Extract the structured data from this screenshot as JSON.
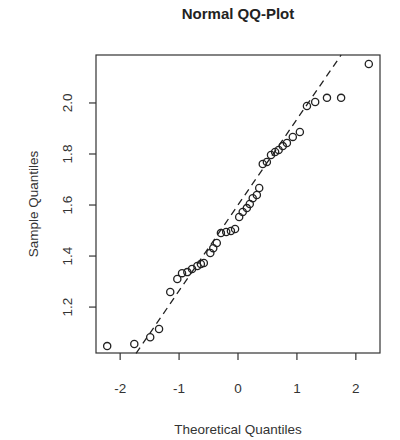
{
  "chart_data": {
    "type": "scatter",
    "title": "Normal QQ-Plot",
    "xlabel": "Theoretical Quantiles",
    "ylabel": "Sample Quantiles",
    "xlim": [
      -2.41,
      2.41
    ],
    "ylim": [
      1.02,
      2.188
    ],
    "grid": false,
    "legend": null,
    "x_ticks": [
      -2,
      -1,
      0,
      1,
      2
    ],
    "x_tick_labels": [
      "-2",
      "-1",
      "0",
      "1",
      "2"
    ],
    "y_ticks": [
      1.2,
      1.4,
      1.6,
      1.8,
      2.0
    ],
    "y_tick_labels": [
      "1.2",
      "1.4",
      "1.6",
      "1.8",
      "2.0"
    ],
    "points": [
      {
        "x": -2.22,
        "y": 1.047
      },
      {
        "x": -1.76,
        "y": 1.055
      },
      {
        "x": -1.49,
        "y": 1.082
      },
      {
        "x": -1.34,
        "y": 1.114
      },
      {
        "x": -1.15,
        "y": 1.259
      },
      {
        "x": -1.03,
        "y": 1.31
      },
      {
        "x": -0.95,
        "y": 1.333
      },
      {
        "x": -0.86,
        "y": 1.337
      },
      {
        "x": -0.78,
        "y": 1.349
      },
      {
        "x": -0.69,
        "y": 1.361
      },
      {
        "x": -0.63,
        "y": 1.369
      },
      {
        "x": -0.58,
        "y": 1.373
      },
      {
        "x": -0.47,
        "y": 1.412
      },
      {
        "x": -0.42,
        "y": 1.431
      },
      {
        "x": -0.36,
        "y": 1.451
      },
      {
        "x": -0.29,
        "y": 1.49
      },
      {
        "x": -0.2,
        "y": 1.494
      },
      {
        "x": -0.12,
        "y": 1.498
      },
      {
        "x": -0.05,
        "y": 1.506
      },
      {
        "x": 0.02,
        "y": 1.553
      },
      {
        "x": 0.08,
        "y": 1.573
      },
      {
        "x": 0.15,
        "y": 1.588
      },
      {
        "x": 0.2,
        "y": 1.604
      },
      {
        "x": 0.25,
        "y": 1.627
      },
      {
        "x": 0.32,
        "y": 1.639
      },
      {
        "x": 0.36,
        "y": 1.667
      },
      {
        "x": 0.42,
        "y": 1.761
      },
      {
        "x": 0.49,
        "y": 1.769
      },
      {
        "x": 0.56,
        "y": 1.796
      },
      {
        "x": 0.63,
        "y": 1.808
      },
      {
        "x": 0.69,
        "y": 1.816
      },
      {
        "x": 0.76,
        "y": 1.831
      },
      {
        "x": 0.83,
        "y": 1.843
      },
      {
        "x": 0.93,
        "y": 1.867
      },
      {
        "x": 1.05,
        "y": 1.886
      },
      {
        "x": 1.17,
        "y": 1.988
      },
      {
        "x": 1.31,
        "y": 2.004
      },
      {
        "x": 1.51,
        "y": 2.02
      },
      {
        "x": 1.75,
        "y": 2.02
      },
      {
        "x": 2.22,
        "y": 2.153
      }
    ],
    "reference_line": {
      "style": "dashed",
      "intercept": 1.6,
      "slope": 0.336,
      "from_x": -1.73,
      "to_x": 1.75
    }
  },
  "colors": {
    "background": "#ffffff",
    "ink": "#222222"
  }
}
